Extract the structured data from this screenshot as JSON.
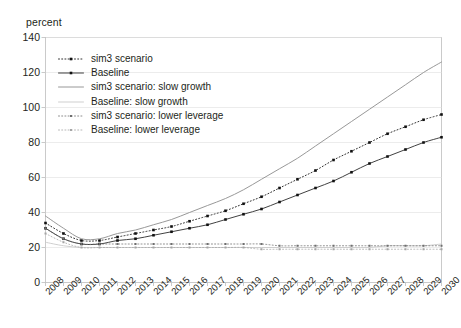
{
  "chart_data": {
    "type": "line",
    "title": "",
    "subtitle": "",
    "ylabel": "percent",
    "xlabel": "",
    "ylim": [
      0,
      140
    ],
    "yticks": [
      0,
      20,
      40,
      60,
      80,
      100,
      120,
      140
    ],
    "grid": true,
    "legend_position": "inside-top-left",
    "categories": [
      "2008",
      "2009",
      "2010",
      "2011",
      "2012",
      "2013",
      "2014",
      "2015",
      "2016",
      "2017",
      "2018",
      "2019",
      "2020",
      "2021",
      "2022",
      "2023",
      "2024",
      "2025",
      "2026",
      "2027",
      "2028",
      "2029",
      "2030"
    ],
    "series": [
      {
        "name": "sim3 scenario",
        "style": "dotted-marker-dark",
        "color": "#1a1a1a",
        "values": [
          34,
          28,
          24,
          24,
          26,
          28,
          30,
          32,
          35,
          38,
          41,
          45,
          49,
          54,
          59,
          64,
          70,
          75,
          80,
          85,
          89,
          93,
          96
        ]
      },
      {
        "name": "Baseline",
        "style": "solid-marker-dark",
        "color": "#2b2b2b",
        "values": [
          31,
          25,
          22,
          22,
          24,
          25,
          27,
          29,
          31,
          33,
          36,
          39,
          42,
          46,
          50,
          54,
          58,
          63,
          68,
          72,
          76,
          80,
          83
        ]
      },
      {
        "name": "sim3 scenario: slow growth",
        "style": "solid-thin-gray",
        "color": "#8c8c8c",
        "values": [
          38,
          31,
          25,
          25,
          28,
          30,
          33,
          36,
          40,
          44,
          48,
          53,
          59,
          65,
          71,
          78,
          85,
          92,
          99,
          106,
          113,
          120,
          126
        ]
      },
      {
        "name": "Baseline: slow growth",
        "style": "solid-thin-lightgray",
        "color": "#c9c9c9",
        "values": [
          23,
          21,
          20,
          20,
          20,
          20,
          20,
          20,
          20,
          20,
          20,
          20,
          20,
          20,
          20,
          20,
          20,
          20,
          20,
          21,
          21,
          21,
          22
        ]
      },
      {
        "name": "sim3 scenario: lower leverage",
        "style": "dotted-marker-gray",
        "color": "#6e6e6e",
        "values": [
          31,
          25,
          22,
          22,
          22,
          22,
          22,
          22,
          22,
          22,
          22,
          22,
          22,
          21,
          21,
          21,
          21,
          21,
          21,
          21,
          21,
          21,
          21
        ]
      },
      {
        "name": "Baseline: lower leverage",
        "style": "dotted-marker-lightgray",
        "color": "#a5a5a5",
        "values": [
          28,
          23,
          20,
          20,
          20,
          20,
          20,
          20,
          20,
          20,
          20,
          20,
          19,
          19,
          19,
          19,
          19,
          19,
          19,
          19,
          19,
          19,
          19
        ]
      }
    ]
  },
  "colors": {
    "axis": "#bdbdbd",
    "grid": "#e4e4e4",
    "text": "#231f20",
    "background": "#ffffff"
  }
}
